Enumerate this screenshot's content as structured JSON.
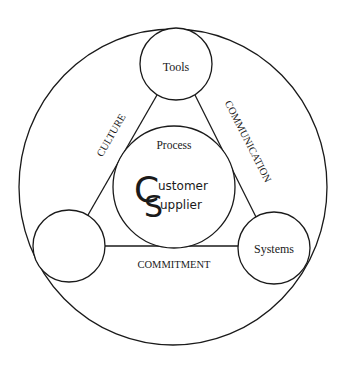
{
  "diagram": {
    "center": {
      "label": "Process",
      "logo": {
        "big_letters": [
          "C",
          "S"
        ],
        "words": [
          "ustomer",
          "upplier"
        ],
        "full_text": [
          "Customer",
          "Supplier"
        ]
      }
    },
    "nodes": [
      {
        "id": "top",
        "label": "Tools"
      },
      {
        "id": "bottom-left",
        "label": ""
      },
      {
        "id": "bottom-right",
        "label": "Systems"
      }
    ],
    "edges": [
      {
        "from": "top",
        "to": "bottom-left",
        "label": "CULTURE"
      },
      {
        "from": "top",
        "to": "bottom-right",
        "label": "COMMUNICATION"
      },
      {
        "from": "bottom-left",
        "to": "bottom-right",
        "label": "COMMITMENT"
      }
    ],
    "colors": {
      "stroke": "#1a1a1a",
      "background": "#ffffff"
    }
  }
}
